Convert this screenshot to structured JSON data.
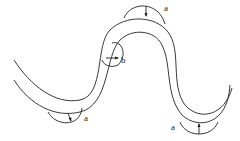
{
  "diagram": {
    "type": "meandering channel with stress/flow bulges",
    "labels": [
      {
        "id": "label-a-top",
        "text": "a",
        "x": 164,
        "y": 5
      },
      {
        "id": "label-b",
        "text": "b",
        "x": 120,
        "y": 57
      },
      {
        "id": "label-a-left",
        "text": "a",
        "x": 82,
        "y": 115
      },
      {
        "id": "label-a-right",
        "text": "a",
        "x": 170,
        "y": 124
      }
    ],
    "stroke_color": "#222222",
    "background": "#ffffff"
  }
}
